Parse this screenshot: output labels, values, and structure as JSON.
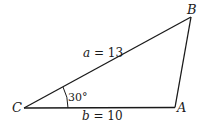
{
  "diagram": {
    "type": "triangle",
    "stroke_color": "#1a1a1a",
    "vertices": [
      {
        "name": "C",
        "x": 24,
        "y": 108
      },
      {
        "name": "A",
        "x": 175,
        "y": 107
      },
      {
        "name": "B",
        "x": 191,
        "y": 17
      }
    ],
    "labels": {
      "vertex_c": "C",
      "vertex_a": "A",
      "vertex_b": "B",
      "side_a_var": "a",
      "side_a_value": " = 13",
      "side_b_var": "b",
      "side_b_value": " = 10",
      "angle_c": "30°"
    }
  }
}
